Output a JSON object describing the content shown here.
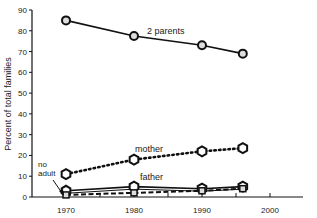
{
  "chart_data": {
    "type": "line",
    "title": "",
    "xlabel": "",
    "ylabel": "Percent of total families",
    "xlim": [
      1965,
      2000
    ],
    "ylim": [
      0,
      90
    ],
    "x_ticks": [
      1970,
      1975,
      1980,
      1985,
      1990,
      1995,
      2000
    ],
    "x_tick_labels": [
      "1970",
      "1980",
      "1990",
      "2000"
    ],
    "y_ticks": [
      0,
      10,
      20,
      30,
      40,
      50,
      60,
      70,
      80,
      90
    ],
    "grid": false,
    "legend": "inline labels",
    "x": [
      1970,
      1980,
      1990,
      1996
    ],
    "series": [
      {
        "name": "2 parents",
        "values": [
          85,
          77.5,
          73,
          69
        ],
        "style": "solid"
      },
      {
        "name": "mother",
        "values": [
          11,
          18,
          22,
          23.5
        ],
        "style": "dotted"
      },
      {
        "name": "father",
        "values": [
          3,
          5,
          4,
          5
        ],
        "style": "solid"
      },
      {
        "name": "no adult",
        "values": [
          1,
          2,
          3,
          4
        ],
        "style": "dashed"
      }
    ],
    "annotations": [
      "2 parents",
      "mother",
      "father",
      "no adult"
    ]
  },
  "labels": {
    "ylabel": "Percent of total families",
    "two_parents": "2 parents",
    "mother": "mother",
    "father": "father",
    "no_adult_1": "no",
    "no_adult_2": "adult"
  }
}
